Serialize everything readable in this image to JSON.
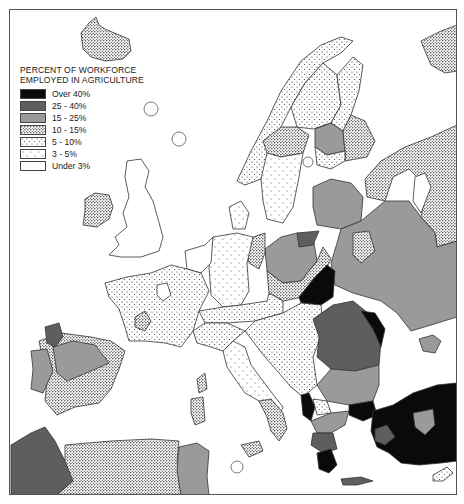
{
  "legend": {
    "title_line1": "PERCENT OF WORKFORCE",
    "title_line2": "EMPLOYED IN AGRICULTURE",
    "items": [
      {
        "label": "Over 40%",
        "class": "over40",
        "fill": "#0a0a0a"
      },
      {
        "label": "25 - 40%",
        "class": "p25_40",
        "fill": "#5e5e5e"
      },
      {
        "label": "15 - 25%",
        "class": "p15_25",
        "fill": "#9a9a9a"
      },
      {
        "label": "10 - 15%",
        "class": "p10_15",
        "fill": "dense-dots"
      },
      {
        "label": "5 - 10%",
        "class": "p5_10",
        "fill": "medium-dots"
      },
      {
        "label": "3 - 5%",
        "class": "p3_5",
        "fill": "sparse-dots"
      },
      {
        "label": "Under 3%",
        "class": "under3",
        "fill": "#ffffff"
      }
    ]
  },
  "colors": {
    "over40": "#0a0a0a",
    "p25_40": "#5e5e5e",
    "p15_25": "#9a9a9a",
    "border": "#333333"
  },
  "map": {
    "subject": "Europe",
    "regions": [
      {
        "name": "Iceland",
        "category": "10 - 15%"
      },
      {
        "name": "Ireland",
        "category": "10 - 15%"
      },
      {
        "name": "Great Britain",
        "category": "Under 3%"
      },
      {
        "name": "Norway",
        "category": "5 - 10%"
      },
      {
        "name": "Sweden north",
        "category": "5 - 10%"
      },
      {
        "name": "Sweden central",
        "category": "10 - 15%"
      },
      {
        "name": "Sweden south",
        "category": "3 - 5%"
      },
      {
        "name": "Finland north",
        "category": "5 - 10%"
      },
      {
        "name": "Finland west",
        "category": "15 - 25%"
      },
      {
        "name": "Finland east",
        "category": "10 - 15%"
      },
      {
        "name": "Denmark",
        "category": "3 - 5%"
      },
      {
        "name": "Netherlands / Belgium",
        "category": "Under 3%"
      },
      {
        "name": "France",
        "category": "5 - 10%"
      },
      {
        "name": "West Germany",
        "category": "3 - 5%"
      },
      {
        "name": "East Germany",
        "category": "10 - 15%"
      },
      {
        "name": "Poland",
        "category": "15 - 25%"
      },
      {
        "name": "Czechoslovakia",
        "category": "10 - 15%"
      },
      {
        "name": "Austria / Switzerland",
        "category": "5 - 10%"
      },
      {
        "name": "Italy north",
        "category": "5 - 10%"
      },
      {
        "name": "Italy south",
        "category": "10 - 15%"
      },
      {
        "name": "Sardinia / Corsica / Sicily",
        "category": "10 - 15%"
      },
      {
        "name": "Yugoslavia",
        "category": "5 - 10%"
      },
      {
        "name": "Albania",
        "category": "Over 40%"
      },
      {
        "name": "Hungary east",
        "category": "Over 40%"
      },
      {
        "name": "Romania",
        "category": "25 - 40%"
      },
      {
        "name": "Moldova",
        "category": "Over 40%"
      },
      {
        "name": "Bulgaria",
        "category": "15 - 25%"
      },
      {
        "name": "Greece north",
        "category": "25 - 40%"
      },
      {
        "name": "Greece south",
        "category": "Over 40%"
      },
      {
        "name": "Crete",
        "category": "25 - 40%"
      },
      {
        "name": "Turkey",
        "category": "Over 40%"
      },
      {
        "name": "Turkey central",
        "category": "15 - 25%"
      },
      {
        "name": "Cyprus",
        "category": "5 - 10%"
      },
      {
        "name": "Baltic states",
        "category": "15 - 25%"
      },
      {
        "name": "Belarus / Ukraine",
        "category": "15 - 25%"
      },
      {
        "name": "Russia",
        "category": "10 - 15%"
      },
      {
        "name": "Crimea",
        "category": "15 - 25%"
      },
      {
        "name": "Spain",
        "category": "10 - 15%"
      },
      {
        "name": "Spain north-central",
        "category": "15 - 25%"
      },
      {
        "name": "Galicia",
        "category": "25 - 40%"
      },
      {
        "name": "Portugal",
        "category": "15 - 25%"
      },
      {
        "name": "Morocco",
        "category": "25 - 40%"
      },
      {
        "name": "Algeria",
        "category": "10 - 15%"
      },
      {
        "name": "Tunisia",
        "category": "15 - 25%"
      }
    ]
  }
}
